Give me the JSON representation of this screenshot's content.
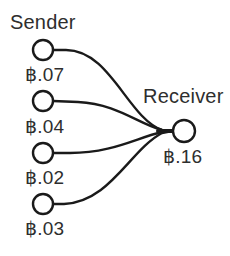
{
  "diagram": {
    "type": "transaction-flow",
    "sender": {
      "title": "Sender",
      "inputs": [
        {
          "amount": "฿.07",
          "cx": 43,
          "cy": 50
        },
        {
          "amount": "฿.04",
          "cx": 43,
          "cy": 101
        },
        {
          "amount": "฿.02",
          "cx": 43,
          "cy": 153
        },
        {
          "amount": "฿.03",
          "cx": 43,
          "cy": 204
        }
      ]
    },
    "receiver": {
      "title": "Receiver",
      "amount": "฿.16",
      "cx": 184,
      "cy": 131
    },
    "edges": [
      {
        "from": "sender.inputs.0",
        "to": "receiver"
      },
      {
        "from": "sender.inputs.1",
        "to": "receiver"
      },
      {
        "from": "sender.inputs.2",
        "to": "receiver"
      },
      {
        "from": "sender.inputs.3",
        "to": "receiver"
      }
    ],
    "colors": {
      "stroke": "#1a1a1a",
      "text": "#2e2e2e",
      "background": "#ffffff"
    }
  }
}
